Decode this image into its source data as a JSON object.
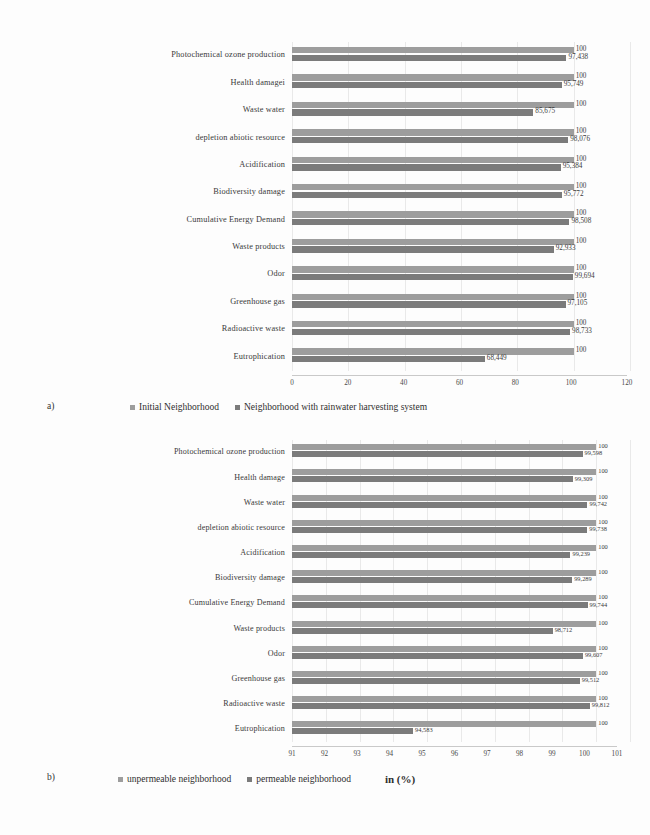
{
  "figures": [
    {
      "id": "a",
      "panel_letter": "a)",
      "legend": [
        {
          "label": "Initial Neighborhood",
          "color": "#9d9d9d"
        },
        {
          "label": "Neighborhood with rainwater harvesting system",
          "color": "#7b7b7b"
        }
      ],
      "chart": {
        "type": "bar",
        "orientation": "horizontal",
        "title": "",
        "xlabel": "",
        "ylabel": "",
        "xlim": [
          0,
          120
        ],
        "ticks": [
          "0",
          "20",
          "40",
          "60",
          "80",
          "100",
          "120"
        ],
        "grid": true,
        "legend_position": "bottom",
        "categories": [
          "Photochemical ozone production",
          "Health damagei",
          "Waste water",
          "depletion abiotic resource",
          "Acidification",
          "Biodiversity damage",
          "Cumulative Energy Demand",
          "Waste products",
          "Odor",
          "Greenhouse gas",
          "Radioactive waste",
          "Eutrophication"
        ],
        "series": [
          {
            "name": "Initial Neighborhood",
            "values": [
              100,
              100,
              100,
              100,
              100,
              100,
              100,
              100,
              100,
              100,
              100,
              100
            ],
            "labels": [
              "100",
              "100",
              "100",
              "100",
              "100",
              "100",
              "100",
              "100",
              "100",
              "100",
              "100",
              "100"
            ]
          },
          {
            "name": "Neighborhood with rainwater harvesting system",
            "values": [
              97.438,
              95.749,
              85.675,
              98.076,
              95.384,
              95.772,
              98.508,
              92.933,
              99.694,
              97.105,
              98.733,
              68.449
            ],
            "labels": [
              "97,438",
              "95,749",
              "85,675",
              "98,076",
              "95,384",
              "95,772",
              "98,508",
              "92,933",
              "99,694",
              "97,105",
              "98,733",
              "68,449"
            ]
          }
        ]
      }
    },
    {
      "id": "b",
      "panel_letter": "b)",
      "unit_label": "in (%)",
      "legend": [
        {
          "label": "unpermeable neighborhood",
          "color": "#9d9d9d"
        },
        {
          "label": "permeable neighborhood",
          "color": "#7b7b7b"
        }
      ],
      "chart": {
        "type": "bar",
        "orientation": "horizontal",
        "title": "",
        "xlabel": "in (%)",
        "ylabel": "",
        "xlim": [
          91,
          101
        ],
        "ticks": [
          "91",
          "92",
          "93",
          "94",
          "95",
          "96",
          "97",
          "98",
          "99",
          "100",
          "101"
        ],
        "grid": true,
        "legend_position": "bottom",
        "categories": [
          "Photochemical ozone production",
          "Health damage",
          "Waste water",
          "depletion abiotic resource",
          "Acidification",
          "Biodiversity damage",
          "Cumulative Energy Demand",
          "Waste products",
          "Odor",
          "Greenhouse gas",
          "Radioactive waste",
          "Eutrophication"
        ],
        "series": [
          {
            "name": "unpermeable neighborhood",
            "values": [
              100,
              100,
              100,
              100,
              100,
              100,
              100,
              100,
              100,
              100,
              100,
              100
            ],
            "labels": [
              "100",
              "100",
              "100",
              "100",
              "100",
              "100",
              "100",
              "100",
              "100",
              "100",
              "100",
              "100"
            ]
          },
          {
            "name": "permeable neighborhood",
            "values": [
              99.598,
              99.309,
              99.742,
              99.738,
              99.239,
              99.289,
              99.744,
              98.712,
              99.607,
              99.512,
              99.812,
              94.583
            ],
            "labels": [
              "99,598",
              "99,309",
              "99,742",
              "99,738",
              "99,239",
              "99,289",
              "99,744",
              "98,712",
              "99,607",
              "99,512",
              "99,812",
              "94,583"
            ]
          }
        ]
      }
    }
  ]
}
